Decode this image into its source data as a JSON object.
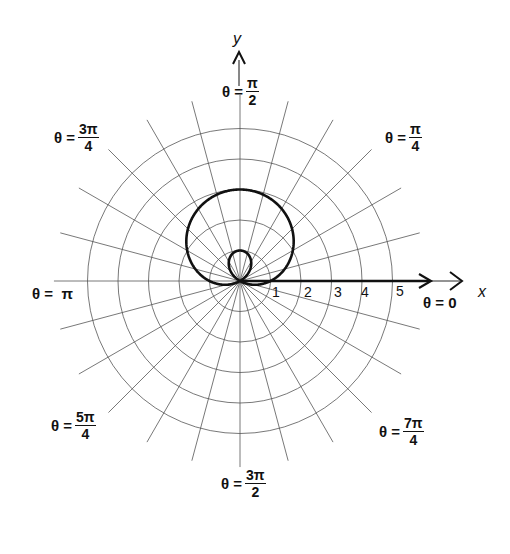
{
  "chart_data": {
    "type": "polar-line",
    "title": "",
    "equation_implied": "r = 1 + 2 sin θ",
    "curve": "limaçon with inner loop",
    "rings": [
      1,
      2,
      3,
      4,
      5
    ],
    "radial_line_step": "π/12",
    "axis_labels": {
      "x": "x",
      "y": "y"
    },
    "r_tick_labels": [
      "1",
      "2",
      "3",
      "4",
      "5"
    ],
    "angle_labels": [
      {
        "angle": "0",
        "text": "θ = 0"
      },
      {
        "angle": "π/4",
        "text": "θ = π/4"
      },
      {
        "angle": "π/2",
        "text": "θ = π/2"
      },
      {
        "angle": "3π/4",
        "text": "θ = 3π/4"
      },
      {
        "angle": "π",
        "text": "θ = π"
      },
      {
        "angle": "5π/4",
        "text": "θ = 5π/4"
      },
      {
        "angle": "3π/2",
        "text": "θ = 3π/2"
      },
      {
        "angle": "7π/4",
        "text": "θ = 7π/4"
      }
    ],
    "key_points": [
      {
        "theta": "0",
        "r": 1
      },
      {
        "theta": "π/2",
        "r": 3
      },
      {
        "theta": "π",
        "r": 1
      },
      {
        "theta": "7π/6",
        "r": 0
      },
      {
        "theta": "3π/2",
        "r": -1
      },
      {
        "theta": "11π/6",
        "r": 0
      }
    ]
  },
  "labels": {
    "x_axis": "x",
    "y_axis": "y",
    "theta_prefix": "θ =",
    "pi": "π",
    "theta0": "0",
    "theta_pi": "π",
    "pi_over_2": {
      "num": "π",
      "den": "2"
    },
    "pi_over_4": {
      "num": "π",
      "den": "4"
    },
    "three_pi_over_4": {
      "num": "3π",
      "den": "4"
    },
    "five_pi_over_4": {
      "num": "5π",
      "den": "4"
    },
    "three_pi_over_2": {
      "num": "3π",
      "den": "2"
    },
    "seven_pi_over_4": {
      "num": "7π",
      "den": "4"
    },
    "ticks": [
      "1",
      "2",
      "3",
      "4",
      "5"
    ]
  }
}
